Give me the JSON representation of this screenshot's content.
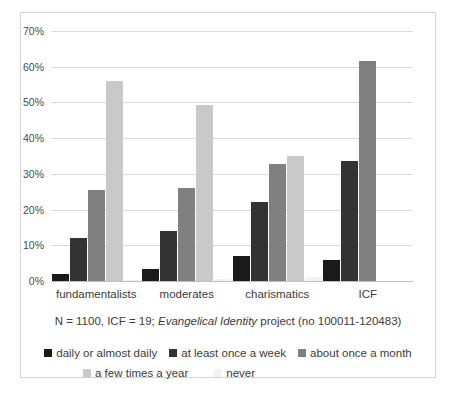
{
  "chart_data": {
    "type": "bar",
    "title": "",
    "subtitle": "",
    "xlabel": "",
    "ylabel": "",
    "categories": [
      "fundamentalists",
      "moderates",
      "charismatics",
      "ICF"
    ],
    "series": [
      {
        "name": "daily or almost daily",
        "color": "#1a1a1a",
        "values": [
          2.0,
          3.5,
          7.0,
          6.0
        ]
      },
      {
        "name": "at least once a week",
        "color": "#333333",
        "values": [
          12.0,
          14.0,
          22.0,
          33.5
        ]
      },
      {
        "name": "about once a month",
        "color": "#808080",
        "values": [
          25.5,
          26.0,
          32.7,
          61.5
        ]
      },
      {
        "name": "a few times a year",
        "color": "#c9c9c9",
        "values": [
          56.0,
          49.2,
          35.0,
          0.0
        ]
      },
      {
        "name": "never",
        "color": "#f2f2f2",
        "values": [
          0.4,
          0.5,
          1.0,
          0.0
        ]
      }
    ],
    "ylim": [
      0,
      70
    ],
    "ytick_values": [
      0,
      10,
      20,
      30,
      40,
      50,
      60,
      70
    ],
    "ytick_labels": [
      "0%",
      "10%",
      "20%",
      "30%",
      "40%",
      "50%",
      "60%",
      "70%"
    ],
    "grid": true,
    "legend_position": "bottom",
    "caption_prefix": "N = 1100, ICF = 19; ",
    "caption_italic": "Evangelical Identity",
    "caption_suffix": " project (no 100011-120483)"
  },
  "frame": {
    "border_color": "#d4d4d4",
    "background": "#ffffff"
  }
}
